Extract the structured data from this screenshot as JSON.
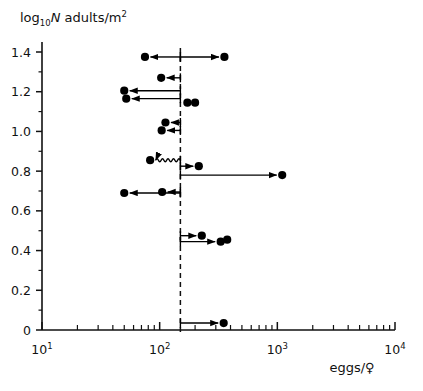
{
  "chart_data": {
    "type": "scatter",
    "title": "",
    "ylabel": "log10N adults/m2",
    "ylabel_parts": {
      "main": "log",
      "sub": "10",
      "italic": "N",
      "rest": " adults/m",
      "sup": "2"
    },
    "xlabel": "eggs/♀",
    "xscale": "log",
    "xlim": [
      10,
      10000
    ],
    "ylim": [
      0,
      1.5
    ],
    "grid": false,
    "legend": null,
    "x_tick_labels": [
      "10¹",
      "10²",
      "10³",
      "10⁴"
    ],
    "x_tick_values": [
      10,
      100,
      1000,
      10000
    ],
    "y_tick_labels": [
      "0",
      "0.2",
      "0.4",
      "0.6",
      "0.8",
      "1.0",
      "1.2",
      "1.4"
    ],
    "y_tick_values": [
      0,
      0.2,
      0.4,
      0.6,
      0.8,
      1.0,
      1.2,
      1.4
    ],
    "y_minor_tick_values": [
      0.1,
      0.3,
      0.5,
      0.7,
      0.9,
      1.1,
      1.3
    ],
    "reference_line": {
      "x": 150,
      "style": "dashed",
      "label": ""
    },
    "points": [
      {
        "x": 75,
        "y": 1.375,
        "arrow": "left",
        "from_x": 150,
        "note": "arrow points left toward point"
      },
      {
        "x": 355,
        "y": 1.375,
        "arrow": "right",
        "from_x": 150
      },
      {
        "x": 103,
        "y": 1.27,
        "arrow": "left",
        "from_x": 150
      },
      {
        "x": 50,
        "y": 1.205,
        "arrow": "left",
        "from_x": 150
      },
      {
        "x": 52,
        "y": 1.165,
        "arrow": "left",
        "from_x": 150
      },
      {
        "x": 172,
        "y": 1.145,
        "arrow": "none",
        "from_x": null
      },
      {
        "x": 200,
        "y": 1.145,
        "arrow": "none",
        "from_x": null
      },
      {
        "x": 112,
        "y": 1.045,
        "arrow": "left",
        "from_x": 150
      },
      {
        "x": 104,
        "y": 1.005,
        "arrow": "left",
        "from_x": 150
      },
      {
        "x": 83,
        "y": 0.855,
        "arrow": "left",
        "from_x": 150,
        "connector": "wavy"
      },
      {
        "x": 215,
        "y": 0.825,
        "arrow": "right",
        "from_x": 150
      },
      {
        "x": 1100,
        "y": 0.78,
        "arrow": "right",
        "from_x": 150
      },
      {
        "x": 50,
        "y": 0.69,
        "arrow": "left",
        "from_x": 150
      },
      {
        "x": 105,
        "y": 0.695,
        "arrow": "left",
        "from_x": 150
      },
      {
        "x": 228,
        "y": 0.475,
        "arrow": "right",
        "from_x": 150
      },
      {
        "x": 330,
        "y": 0.445,
        "arrow": "right",
        "from_x": 150
      },
      {
        "x": 375,
        "y": 0.455,
        "arrow": "none",
        "from_x": null
      },
      {
        "x": 350,
        "y": 0.035,
        "arrow": "right",
        "from_x": 150
      }
    ]
  },
  "figure": {
    "marker_color": "#000000",
    "axis_color": "#111111",
    "background": "#ffffff"
  }
}
